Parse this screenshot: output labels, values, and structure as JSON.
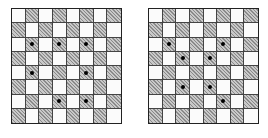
{
  "figure": {
    "boards": [
      {
        "id": "left",
        "rows": 8,
        "cols": 8,
        "hatched_rule": "(row+col) odd",
        "dots": [
          [
            2,
            1
          ],
          [
            2,
            3
          ],
          [
            2,
            5
          ],
          [
            4,
            1
          ],
          [
            4,
            5
          ],
          [
            6,
            3
          ],
          [
            6,
            5
          ]
        ]
      },
      {
        "id": "right",
        "rows": 8,
        "cols": 8,
        "hatched_rule": "(row+col) odd",
        "dots": [
          [
            2,
            1
          ],
          [
            2,
            5
          ],
          [
            3,
            2
          ],
          [
            3,
            4
          ],
          [
            5,
            2
          ],
          [
            5,
            4
          ],
          [
            6,
            5
          ]
        ]
      }
    ],
    "colors": {
      "light_square": "#fbfbfb",
      "hatched_square": "#b9b9b9",
      "grid_line": "#444444",
      "dot": "#000000"
    }
  }
}
